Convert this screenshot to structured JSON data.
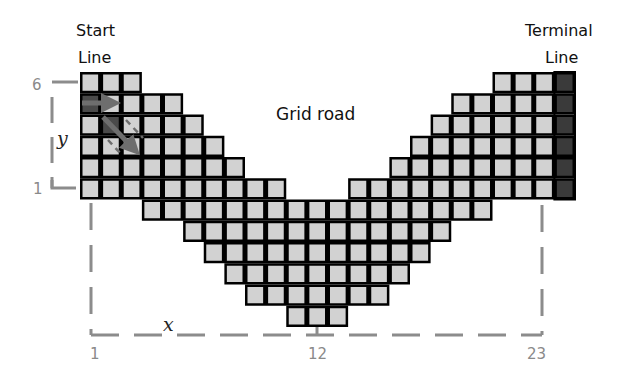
{
  "labels": {
    "start_line_1": "Start",
    "start_line_2": "Line",
    "terminal_line_1": "Terminal",
    "terminal_line_2": "Line",
    "grid_road": "Grid road",
    "y_axis_var": "y",
    "x_axis_var": "x",
    "y_tick_top": "6",
    "y_tick_bottom": "1",
    "x_tick_left": "1",
    "x_tick_mid": "12",
    "x_tick_right": "23"
  },
  "colors": {
    "cell_fill": "#d2d2d2",
    "cell_border": "#000000",
    "terminal_cell_fill": "#3a3a3a",
    "agent_cell_fill": "#4a4a4a",
    "arrow": "#6e6e6e",
    "dashed_axis": "#8c8c8c"
  },
  "grid": {
    "origin_x": 80,
    "origin_y": 72,
    "cell_w": 20.625,
    "cell_h": 21.25,
    "columns": 24,
    "rows": 12,
    "row_spans": [
      [
        [
          1,
          3
        ],
        [
          21,
          24
        ]
      ],
      [
        [
          1,
          5
        ],
        [
          19,
          24
        ]
      ],
      [
        [
          1,
          6
        ],
        [
          18,
          24
        ]
      ],
      [
        [
          1,
          7
        ],
        [
          17,
          24
        ]
      ],
      [
        [
          1,
          8
        ],
        [
          16,
          24
        ]
      ],
      [
        [
          1,
          10
        ],
        [
          14,
          24
        ]
      ],
      [
        [
          4,
          20
        ]
      ],
      [
        [
          6,
          18
        ]
      ],
      [
        [
          7,
          17
        ]
      ],
      [
        [
          8,
          16
        ]
      ],
      [
        [
          9,
          15
        ]
      ],
      [
        [
          11,
          13
        ]
      ]
    ],
    "terminal_column": 24,
    "terminal_rows": [
      1,
      2,
      3,
      4,
      5,
      6
    ],
    "agent_cells": [
      [
        2,
        1
      ],
      [
        3,
        2
      ]
    ]
  }
}
